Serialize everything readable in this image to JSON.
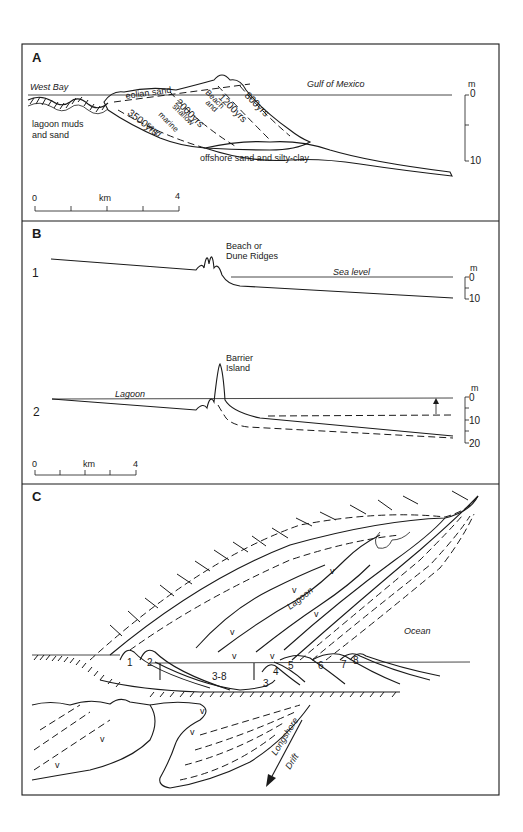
{
  "figure": {
    "panels": [
      {
        "id": "A",
        "label": "A",
        "labels": {
          "west_bay": "West Bay",
          "gulf": "Gulf of Mexico",
          "eolian": "eolian   sand",
          "lagoon_muds_1": "lagoon muds",
          "lagoon_muds_2": "and sand",
          "yrs_3500": "3500yrs",
          "yrs_2000": "2000yrs",
          "yrs_1200": "1200yrs",
          "yrs_800": "800yrs",
          "marine_sand_1": "marine",
          "marine_sand_2": "sand",
          "shallow": "shallow",
          "and": "and",
          "beach": "Beach",
          "offshore": "offshore sand and silty-clay"
        },
        "depth_scale": {
          "unit": "m",
          "ticks": [
            "0",
            "10"
          ]
        },
        "distance_scale": {
          "start": "0",
          "unit": "km",
          "end": "4"
        }
      },
      {
        "id": "B",
        "label": "B",
        "profiles": [
          {
            "number": "1",
            "feature_1": "Beach or",
            "feature_2": "Dune Ridges",
            "sea_level": "Sea level",
            "depth_scale": {
              "unit": "m",
              "ticks": [
                "0",
                "10"
              ]
            }
          },
          {
            "number": "2",
            "feature_1": "Barrier",
            "feature_2": "Island",
            "lagoon": "Lagoon",
            "depth_scale": {
              "unit": "m",
              "ticks": [
                "0",
                "10",
                "20"
              ]
            }
          }
        ],
        "distance_scale": {
          "start": "0",
          "unit": "km",
          "end": "4"
        }
      },
      {
        "id": "C",
        "label": "C",
        "labels": {
          "lagoon": "Lagoon",
          "ocean": "Ocean",
          "longshore": "Longshore",
          "drift": "Drift",
          "ridges": [
            "1",
            "2",
            "3-8",
            "3",
            "4",
            "5",
            "6",
            "7",
            "8"
          ]
        }
      }
    ]
  }
}
